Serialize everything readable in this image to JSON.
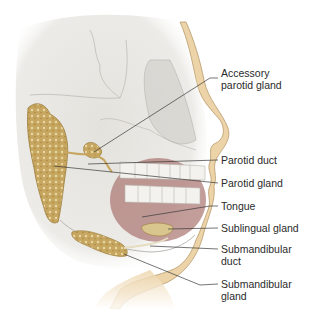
{
  "figure": {
    "colors": {
      "skin": "#ecd3a8",
      "skin_outline": "#b79a6c",
      "skull": "#e6e4df",
      "skull_line": "#b8b6b0",
      "gland": "#c9a964",
      "gland_dark": "#9c7c3c",
      "tongue": "#a9746f",
      "teeth": "#f4f2ee",
      "leader_line": "#3a3a3a",
      "text": "#2a2a2a"
    },
    "labels": [
      {
        "id": "accessory-parotid",
        "lines": [
          "Accessory",
          "parotid gland"
        ]
      },
      {
        "id": "parotid-duct",
        "lines": [
          "Parotid duct"
        ]
      },
      {
        "id": "parotid-gland",
        "lines": [
          "Parotid gland"
        ]
      },
      {
        "id": "tongue",
        "lines": [
          "Tongue"
        ]
      },
      {
        "id": "sublingual-gland",
        "lines": [
          "Sublingual gland"
        ]
      },
      {
        "id": "submandibular-duct",
        "lines": [
          "Submandibular",
          "duct"
        ]
      },
      {
        "id": "submandibular-gland",
        "lines": [
          "Submandibular",
          "gland"
        ]
      }
    ]
  }
}
